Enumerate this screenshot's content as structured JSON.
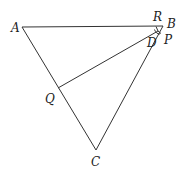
{
  "diagram": {
    "type": "geometry",
    "points": {
      "A": {
        "label": "A",
        "x": 22,
        "y": 27
      },
      "B": {
        "label": "B",
        "x": 163,
        "y": 26
      },
      "C": {
        "label": "C",
        "x": 96,
        "y": 150
      },
      "Q": {
        "label": "Q",
        "x": 58,
        "y": 88
      },
      "D": {
        "label": "D",
        "x": 158,
        "y": 31
      },
      "R": {
        "label": "R",
        "x": 155,
        "y": 26
      },
      "P": {
        "label": "P",
        "x": 161,
        "y": 36
      }
    },
    "segments": [
      [
        "A",
        "B"
      ],
      [
        "B",
        "C"
      ],
      [
        "A",
        "C"
      ],
      [
        "Q",
        "D"
      ],
      [
        "D",
        "R"
      ],
      [
        "D",
        "P"
      ]
    ],
    "labels": {
      "A": "A",
      "B": "B",
      "C": "C",
      "Q": "Q",
      "D": "D",
      "R": "R",
      "P": "P"
    }
  }
}
